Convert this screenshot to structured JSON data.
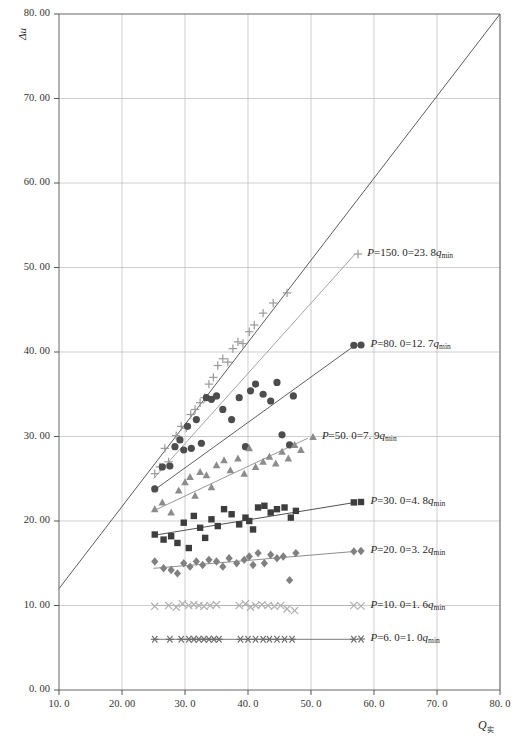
{
  "chart_data": {
    "type": "scatter",
    "title": "",
    "xlabel": "Q实",
    "ylabel": "Δu",
    "xlim": [
      10.0,
      80.0
    ],
    "ylim": [
      0.0,
      80.0
    ],
    "grid": true,
    "x_ticks": [
      "10. 0",
      "20. 00",
      "30. 0",
      "40. 0",
      "50. 0",
      "60. 0",
      "70. 0",
      "80. 0"
    ],
    "x_tick_values": [
      10,
      20,
      30,
      40,
      50,
      60,
      70,
      80
    ],
    "y_ticks": [
      "0. 00",
      "10. 00",
      "20. 00",
      "30. 00",
      "40. 00",
      "50. 00",
      "60. 00",
      "70. 00",
      "80. 00"
    ],
    "y_tick_values": [
      0,
      10,
      20,
      30,
      40,
      50,
      60,
      70,
      80
    ],
    "reference_line": {
      "name": "one-to-one-line",
      "x": [
        10.0,
        80.0
      ],
      "y": [
        12.0,
        80.0
      ],
      "color": "#4a4a4a"
    },
    "legend_position": "right-inline",
    "series": [
      {
        "name": "P=150.0",
        "label_P": "P",
        "label": "P=150. 0=23. 8q",
        "label_prefix": "P",
        "label_mid": "=150. 0=23. 8",
        "label_q": "q",
        "label_sub": "min",
        "marker": "plus",
        "color": "#9a9a9a",
        "q_ratio": 23.8,
        "P": 150.0,
        "points": [
          [
            25.2,
            25.6
          ],
          [
            26.0,
            26.4
          ],
          [
            26.8,
            28.6
          ],
          [
            27.4,
            27.0
          ],
          [
            28.6,
            30.1
          ],
          [
            29.4,
            31.2
          ],
          [
            30.2,
            31.0
          ],
          [
            30.9,
            32.6
          ],
          [
            31.6,
            33.2
          ],
          [
            32.4,
            34.0
          ],
          [
            33.1,
            34.6
          ],
          [
            33.8,
            36.2
          ],
          [
            34.5,
            37.0
          ],
          [
            35.2,
            38.4
          ],
          [
            36.0,
            39.2
          ],
          [
            36.8,
            38.8
          ],
          [
            37.6,
            40.4
          ],
          [
            38.4,
            41.2
          ],
          [
            39.2,
            41.0
          ],
          [
            40.2,
            42.4
          ],
          [
            41.0,
            43.2
          ],
          [
            42.4,
            44.6
          ],
          [
            44.0,
            45.8
          ],
          [
            46.2,
            47.0
          ]
        ],
        "trend": {
          "x": [
            25.0,
            57.0
          ],
          "y": [
            25.0,
            51.6
          ]
        }
      },
      {
        "name": "P=80.0",
        "label_prefix": "P",
        "label_mid": "=80. 0=12. 7",
        "label_q": "q",
        "label_sub": "min",
        "marker": "circle",
        "color": "#4d4d4d",
        "q_ratio": 12.7,
        "P": 80.0,
        "points": [
          [
            25.2,
            23.8
          ],
          [
            26.4,
            26.4
          ],
          [
            27.6,
            26.5
          ],
          [
            28.4,
            28.8
          ],
          [
            29.2,
            29.6
          ],
          [
            29.8,
            28.4
          ],
          [
            30.4,
            31.2
          ],
          [
            31.0,
            28.6
          ],
          [
            31.8,
            32.0
          ],
          [
            32.6,
            29.2
          ],
          [
            33.4,
            34.6
          ],
          [
            34.2,
            34.4
          ],
          [
            35.0,
            34.8
          ],
          [
            36.0,
            33.2
          ],
          [
            37.4,
            32.0
          ],
          [
            38.6,
            34.6
          ],
          [
            39.6,
            28.8
          ],
          [
            40.4,
            35.4
          ],
          [
            41.2,
            36.2
          ],
          [
            42.4,
            35.0
          ],
          [
            43.6,
            34.2
          ],
          [
            44.6,
            36.4
          ],
          [
            45.4,
            30.2
          ],
          [
            46.6,
            29.0
          ],
          [
            47.2,
            34.8
          ],
          [
            56.8,
            40.8
          ]
        ],
        "trend": {
          "x": [
            25.0,
            57.0
          ],
          "y": [
            23.6,
            40.8
          ]
        }
      },
      {
        "name": "P=50.0",
        "label_prefix": "P",
        "label_mid": "=50. 0=7. 9",
        "label_q": "q",
        "label_sub": "min",
        "marker": "triangle",
        "color": "#8c8c8c",
        "q_ratio": 7.9,
        "P": 50.0,
        "points": [
          [
            25.2,
            21.4
          ],
          [
            26.4,
            22.2
          ],
          [
            27.8,
            21.0
          ],
          [
            29.0,
            23.6
          ],
          [
            30.0,
            24.6
          ],
          [
            30.8,
            25.2
          ],
          [
            31.6,
            23.0
          ],
          [
            32.4,
            25.8
          ],
          [
            33.4,
            25.4
          ],
          [
            34.2,
            24.0
          ],
          [
            35.0,
            26.6
          ],
          [
            36.2,
            27.2
          ],
          [
            37.2,
            26.0
          ],
          [
            38.4,
            27.4
          ],
          [
            39.4,
            25.6
          ],
          [
            40.2,
            28.6
          ],
          [
            41.2,
            26.4
          ],
          [
            42.4,
            27.0
          ],
          [
            43.4,
            27.6
          ],
          [
            44.4,
            26.8
          ],
          [
            45.4,
            28.2
          ],
          [
            46.4,
            27.4
          ],
          [
            47.4,
            29.0
          ],
          [
            48.4,
            28.4
          ]
        ],
        "trend": {
          "x": [
            25.0,
            49.5
          ],
          "y": [
            21.2,
            29.8
          ]
        }
      },
      {
        "name": "P=30.0",
        "label_prefix": "P",
        "label_mid": "=30. 0=4. 8",
        "label_q": "q",
        "label_sub": "min",
        "marker": "square",
        "color": "#3d3d3d",
        "q_ratio": 4.8,
        "P": 30.0,
        "points": [
          [
            25.2,
            18.4
          ],
          [
            26.6,
            17.8
          ],
          [
            27.8,
            18.2
          ],
          [
            28.8,
            17.4
          ],
          [
            29.8,
            19.8
          ],
          [
            30.6,
            16.8
          ],
          [
            31.4,
            20.6
          ],
          [
            32.4,
            19.2
          ],
          [
            33.2,
            18.0
          ],
          [
            34.2,
            20.2
          ],
          [
            35.2,
            19.4
          ],
          [
            36.2,
            21.4
          ],
          [
            37.4,
            20.8
          ],
          [
            38.6,
            19.6
          ],
          [
            39.6,
            20.4
          ],
          [
            40.2,
            20.0
          ],
          [
            40.8,
            19.0
          ],
          [
            41.6,
            21.6
          ],
          [
            42.6,
            21.8
          ],
          [
            43.6,
            21.0
          ],
          [
            44.6,
            21.4
          ],
          [
            45.8,
            21.6
          ],
          [
            46.8,
            20.4
          ],
          [
            47.6,
            21.2
          ],
          [
            56.8,
            22.2
          ]
        ],
        "trend": {
          "x": [
            25.0,
            57.0
          ],
          "y": [
            18.3,
            22.2
          ]
        }
      },
      {
        "name": "P=20.0",
        "label_prefix": "P",
        "label_mid": "=20. 0=3. 2",
        "label_q": "q",
        "label_sub": "min",
        "marker": "diamond",
        "color": "#808080",
        "q_ratio": 3.2,
        "P": 20.0,
        "points": [
          [
            25.2,
            15.2
          ],
          [
            26.6,
            14.4
          ],
          [
            27.8,
            14.2
          ],
          [
            28.8,
            13.8
          ],
          [
            29.8,
            15.0
          ],
          [
            30.8,
            14.6
          ],
          [
            31.8,
            15.2
          ],
          [
            32.8,
            14.8
          ],
          [
            33.8,
            15.4
          ],
          [
            35.0,
            15.2
          ],
          [
            36.0,
            14.6
          ],
          [
            37.0,
            15.6
          ],
          [
            38.2,
            15.0
          ],
          [
            39.4,
            15.4
          ],
          [
            40.2,
            15.8
          ],
          [
            40.8,
            14.8
          ],
          [
            41.6,
            16.2
          ],
          [
            42.6,
            15.0
          ],
          [
            43.6,
            16.0
          ],
          [
            44.6,
            15.6
          ],
          [
            45.6,
            15.8
          ],
          [
            46.6,
            13.0
          ],
          [
            47.6,
            16.2
          ],
          [
            56.8,
            16.4
          ]
        ],
        "trend": {
          "x": [
            25.0,
            57.0
          ],
          "y": [
            14.4,
            16.4
          ]
        }
      },
      {
        "name": "P=10.0",
        "label_prefix": "P",
        "label_mid": "=10. 0=1. 6",
        "label_q": "q",
        "label_sub": "min",
        "marker": "cross",
        "color": "#b0b0b0",
        "q_ratio": 1.6,
        "P": 10.0,
        "points": [
          [
            25.2,
            9.9
          ],
          [
            27.4,
            10.0
          ],
          [
            28.6,
            9.8
          ],
          [
            29.6,
            10.2
          ],
          [
            30.6,
            10.0
          ],
          [
            31.4,
            10.1
          ],
          [
            32.2,
            10.0
          ],
          [
            33.0,
            9.9
          ],
          [
            34.0,
            10.0
          ],
          [
            35.0,
            10.1
          ],
          [
            38.6,
            10.0
          ],
          [
            39.6,
            10.2
          ],
          [
            40.4,
            9.8
          ],
          [
            41.2,
            10.0
          ],
          [
            42.2,
            10.1
          ],
          [
            43.2,
            10.0
          ],
          [
            44.2,
            9.9
          ],
          [
            45.2,
            10.0
          ],
          [
            46.2,
            9.6
          ],
          [
            47.4,
            9.4
          ],
          [
            56.8,
            10.0
          ]
        ],
        "trend": {
          "x": [
            25.0,
            57.0
          ],
          "y": [
            10.0,
            10.0
          ]
        }
      },
      {
        "name": "P=6.0",
        "label_prefix": "P",
        "label_mid": "=6. 0=1. 0",
        "label_q": "q",
        "label_sub": "min",
        "marker": "asterisk",
        "color": "#6b6b6b",
        "q_ratio": 1.0,
        "P": 6.0,
        "points": [
          [
            25.2,
            6.0
          ],
          [
            27.6,
            6.0
          ],
          [
            29.4,
            6.0
          ],
          [
            30.6,
            6.0
          ],
          [
            31.4,
            6.0
          ],
          [
            32.2,
            6.0
          ],
          [
            33.0,
            6.0
          ],
          [
            33.8,
            6.0
          ],
          [
            34.6,
            6.0
          ],
          [
            35.4,
            6.0
          ],
          [
            38.8,
            6.0
          ],
          [
            40.0,
            6.0
          ],
          [
            41.2,
            6.0
          ],
          [
            42.4,
            6.0
          ],
          [
            43.4,
            6.0
          ],
          [
            44.6,
            6.0
          ],
          [
            45.8,
            6.0
          ],
          [
            47.0,
            6.0
          ],
          [
            56.8,
            6.0
          ]
        ],
        "trend": {
          "x": [
            25.0,
            57.0
          ],
          "y": [
            6.0,
            6.0
          ]
        }
      }
    ],
    "legend_anchors": [
      {
        "series": 0,
        "x": 57.5,
        "y": 51.6
      },
      {
        "series": 1,
        "x": 58.0,
        "y": 40.8
      },
      {
        "series": 2,
        "x": 50.3,
        "y": 30.0
      },
      {
        "series": 3,
        "x": 58.0,
        "y": 22.2
      },
      {
        "series": 4,
        "x": 58.0,
        "y": 16.4
      },
      {
        "series": 5,
        "x": 58.0,
        "y": 10.0
      },
      {
        "series": 6,
        "x": 58.0,
        "y": 6.0
      }
    ]
  },
  "axes": {
    "ylabel": "Δu",
    "xlabel_main": "Q",
    "xlabel_sub": "实"
  }
}
